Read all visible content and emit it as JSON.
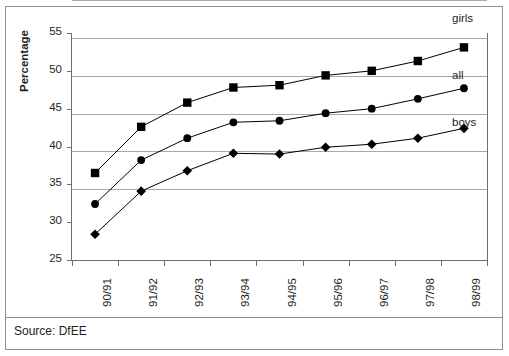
{
  "chart_data": {
    "type": "line",
    "title": "",
    "xlabel": "",
    "ylabel": "Percentage",
    "ylim": [
      25,
      55
    ],
    "ytick_step": 5,
    "yticks": [
      25,
      30,
      35,
      40,
      45,
      50,
      55
    ],
    "grid": true,
    "legend_position": "right-inline-labels",
    "categories": [
      "90/91",
      "91/92",
      "92/93",
      "93/94",
      "94/95",
      "95/96",
      "96/97",
      "97/98",
      "98/99"
    ],
    "series": [
      {
        "name": "girls",
        "marker": "square",
        "color": "#000000",
        "values": [
          36.5,
          42.6,
          45.8,
          47.8,
          48.1,
          49.4,
          50.0,
          51.3,
          53.1
        ]
      },
      {
        "name": "all",
        "marker": "circle",
        "color": "#000000",
        "values": [
          32.4,
          38.2,
          41.1,
          43.2,
          43.4,
          44.4,
          45.0,
          46.3,
          47.7
        ]
      },
      {
        "name": "boys",
        "marker": "diamond",
        "color": "#000000",
        "values": [
          28.4,
          34.1,
          36.8,
          39.1,
          39.0,
          39.9,
          40.3,
          41.1,
          42.4
        ]
      }
    ]
  },
  "footer": {
    "source_text": "Source: DfEE"
  },
  "colors": {
    "gridline": "#a8a8a8",
    "axis": "#6d6d6d",
    "border": "#8f8f8f",
    "text": "#231f20",
    "series": "#000000"
  }
}
